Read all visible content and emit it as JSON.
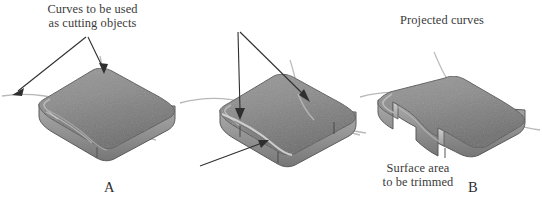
{
  "figure": {
    "width": 542,
    "height": 203,
    "background": "#ffffff",
    "kind": "technical-illustration"
  },
  "annotations": {
    "cutting_curves": {
      "line1": "Curves to be used",
      "line2": "as cutting objects",
      "arrow_count": 2
    },
    "projected_curves": {
      "line1": "Projected curves",
      "arrow_count": 2
    },
    "surface_trimmed": {
      "line1": "Surface area",
      "line2": "to be trimmed",
      "arrow_count": 1
    }
  },
  "panels": [
    {
      "id": "A",
      "letter": "A",
      "caption": "Rounded slab with free cutting curves passing over it"
    },
    {
      "id": "B",
      "letter": "B",
      "caption": "Curves projected onto the slab top surface"
    },
    {
      "id": "C",
      "letter": "C",
      "caption": "Slab after the bounded region is trimmed away"
    }
  ],
  "colors": {
    "top_face": "#8a8a8a",
    "top_face_light": "#a2a2a2",
    "top_face_dark": "#6f6f6f",
    "side_face": "#9a9a9a",
    "side_face_dark": "#787878",
    "edge_line": "#565656",
    "curve_line": "#b3b3b3",
    "arrow": "#2f2f2f",
    "text": "#3a3a3a",
    "letter": "#2e2e2e",
    "background": "#ffffff"
  }
}
